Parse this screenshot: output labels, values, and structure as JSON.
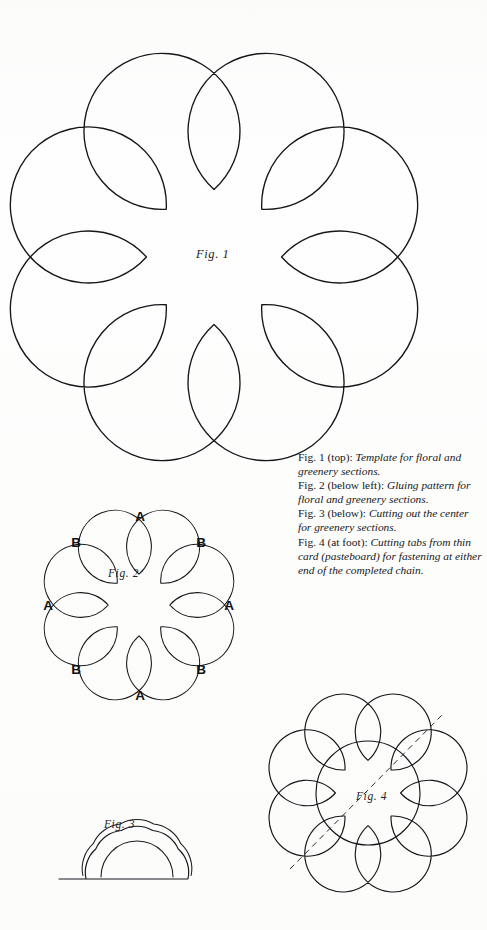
{
  "page": {
    "background_color": "#fdfdfc",
    "ink_color": "#15161a"
  },
  "figures": {
    "fig1": {
      "label": "Fig. 1",
      "name": "large-floral-template",
      "petal_count": 8,
      "description": "Large eight-lobed scalloped flower outline"
    },
    "fig2": {
      "label": "Fig. 2",
      "name": "gluing-pattern-flower",
      "petal_count": 8,
      "petal_letters": [
        {
          "letter": "A",
          "position": "top",
          "x": 140,
          "y": 516
        },
        {
          "letter": "B",
          "position": "upper-left",
          "x": 76,
          "y": 542
        },
        {
          "letter": "B",
          "position": "upper-right",
          "x": 201,
          "y": 542
        },
        {
          "letter": "A",
          "position": "left",
          "x": 48,
          "y": 605
        },
        {
          "letter": "A",
          "position": "right",
          "x": 229,
          "y": 605
        },
        {
          "letter": "B",
          "position": "lower-left",
          "x": 76,
          "y": 669
        },
        {
          "letter": "B",
          "position": "lower-right",
          "x": 201,
          "y": 669
        },
        {
          "letter": "A",
          "position": "bottom",
          "x": 140,
          "y": 695
        }
      ]
    },
    "fig3": {
      "label": "Fig. 3",
      "name": "folded-half-flower-cutting-center",
      "description": "Folded half flower with double outline, flat fold edge and inner cut arc"
    },
    "fig4": {
      "label": "Fig. 4",
      "name": "tab-flower-with-circle",
      "description": "Eight-petal flower with inner circle and dashed diagonal fold line"
    }
  },
  "caption": {
    "lines": [
      {
        "lead": "Fig. 1 (top): ",
        "body": "Template for floral and greenery sections."
      },
      {
        "lead": "Fig. 2 (below left): ",
        "body": "Gluing pattern for floral and greenery sections."
      },
      {
        "lead": "Fig. 3 (below): ",
        "body": "Cutting out the center for greenery sections."
      },
      {
        "lead": "Fig. 4 (at foot): ",
        "body": "Cutting tabs from thin card (pasteboard) for fastening at either end of the completed chain."
      }
    ]
  }
}
